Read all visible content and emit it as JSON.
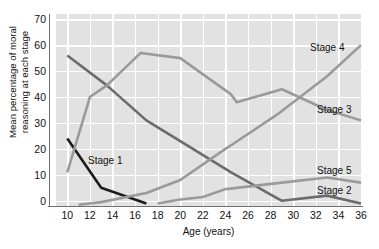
{
  "chart_data": {
    "type": "line",
    "title": "",
    "xlabel": "Age (years)",
    "ylabel": "Mean percentage of moral reasoning at each stage",
    "ylabel_line1": "Mean percentage of moral",
    "ylabel_line2": "reasoning at each stage",
    "xlim": [
      9,
      36
    ],
    "ylim": [
      -2,
      72
    ],
    "x_ticks": [
      10,
      12,
      14,
      16,
      18,
      20,
      22,
      24,
      26,
      28,
      30,
      32,
      34,
      36
    ],
    "y_ticks": [
      0,
      10,
      20,
      30,
      40,
      50,
      60,
      70
    ],
    "grid": true,
    "legend_position": "inline-labels",
    "plot_background": "#e2e2e2",
    "gridline_color": "#ffffff",
    "series": [
      {
        "name": "Stage 1",
        "color": "#1c1c1c",
        "label_x": 88,
        "label_y": 155,
        "x": [
          10,
          13,
          17
        ],
        "values": [
          24,
          5,
          -1
        ]
      },
      {
        "name": "Stage 2",
        "color": "#6b6b6b",
        "label_x": 317,
        "label_y": 185,
        "x": [
          10,
          13.5,
          17,
          20,
          24.5,
          29,
          33,
          36
        ],
        "values": [
          56,
          44.5,
          31,
          23,
          11,
          0,
          2,
          -1
        ]
      },
      {
        "name": "Stage 3",
        "color": "#9a9a9a",
        "label_x": 317,
        "label_y": 104,
        "x": [
          10,
          12,
          13.5,
          16.5,
          20,
          24.5,
          25,
          29,
          33,
          36
        ],
        "values": [
          11,
          40,
          44.5,
          57,
          55,
          41,
          38,
          43,
          35,
          31
        ]
      },
      {
        "name": "Stage 4",
        "color": "#9a9a9a",
        "label_x": 310,
        "label_y": 42,
        "x": [
          11,
          13,
          17,
          20,
          24,
          24.7,
          28.5,
          33,
          36
        ],
        "values": [
          -1.5,
          -0.5,
          3,
          8,
          20,
          22,
          33,
          48,
          60
        ]
      },
      {
        "name": "Stage 5",
        "color": "#9a9a9a",
        "label_x": 317,
        "label_y": 165,
        "x": [
          18,
          20,
          22,
          24,
          25,
          29,
          33,
          36
        ],
        "values": [
          -1,
          0.5,
          1.5,
          4.5,
          5,
          7,
          9,
          7
        ]
      }
    ]
  }
}
